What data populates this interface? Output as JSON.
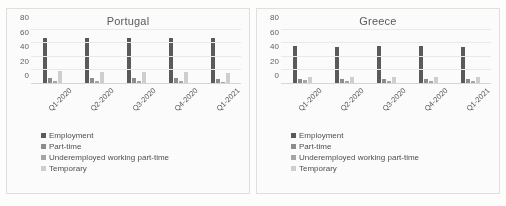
{
  "figure": {
    "background_color": "#fdfdfc",
    "panel_background": "#ffffff",
    "panel_border_color": "#e2e2e2"
  },
  "series_colors": [
    "#595959",
    "#8c8c8c",
    "#a6a6a6",
    "#d0d0d0"
  ],
  "chart_data": [
    {
      "type": "bar",
      "title": "Portugal",
      "xlabel": "",
      "ylabel": "",
      "ylim": [
        0,
        80
      ],
      "yticks": [
        0,
        20,
        40,
        60,
        80
      ],
      "ytick_labels": [
        "0",
        "20",
        "40",
        "60",
        "80"
      ],
      "grid": true,
      "grid_axis": "y",
      "legend_position": "bottom-left",
      "categories": [
        "Q1-2020",
        "Q2-2020",
        "Q3-2020",
        "Q4-2020",
        "Q1-2021"
      ],
      "series": [
        {
          "name": "Employment",
          "color": "#595959",
          "values": [
            68.6,
            67.6,
            68.0,
            68.6,
            68.0
          ]
        },
        {
          "name": "Part-time",
          "color": "#8c8c8c",
          "values": [
            7.5,
            7.1,
            7.0,
            7.2,
            6.8
          ]
        },
        {
          "name": "Underemployed working part-time",
          "color": "#a6a6a6",
          "values": [
            2.4,
            2.8,
            2.5,
            2.3,
            2.2
          ]
        },
        {
          "name": "Temporary",
          "color": "#d0d0d0",
          "values": [
            17.4,
            16.0,
            16.8,
            16.6,
            15.6
          ]
        }
      ]
    },
    {
      "type": "bar",
      "title": "Greece",
      "xlabel": "",
      "ylabel": "",
      "ylim": [
        0,
        80
      ],
      "yticks": [
        0,
        20,
        40,
        60,
        80
      ],
      "ytick_labels": [
        "0",
        "20",
        "40",
        "60",
        "80"
      ],
      "grid": true,
      "grid_axis": "y",
      "legend_position": "bottom-left",
      "categories": [
        "Q1-2020",
        "Q2-2020",
        "Q3-2020",
        "Q4-2020",
        "Q1-2021"
      ],
      "series": [
        {
          "name": "Employment",
          "color": "#595959",
          "values": [
            56.0,
            55.0,
            55.8,
            56.6,
            54.0
          ]
        },
        {
          "name": "Part-time",
          "color": "#8c8c8c",
          "values": [
            6.4,
            6.0,
            5.8,
            6.2,
            5.8
          ]
        },
        {
          "name": "Underemployed working part-time",
          "color": "#a6a6a6",
          "values": [
            3.8,
            3.4,
            3.2,
            3.4,
            3.0
          ]
        },
        {
          "name": "Temporary",
          "color": "#d0d0d0",
          "values": [
            9.8,
            8.6,
            9.4,
            9.0,
            8.4
          ]
        }
      ]
    }
  ]
}
